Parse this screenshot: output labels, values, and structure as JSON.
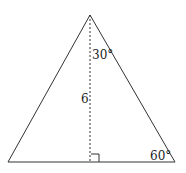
{
  "diagram": {
    "shape": "triangle",
    "labels": {
      "apex_angle": "30°",
      "altitude": "6",
      "base_right_angle": "60°"
    },
    "colors": {
      "stroke": "#333333",
      "background": "#ffffff"
    }
  }
}
